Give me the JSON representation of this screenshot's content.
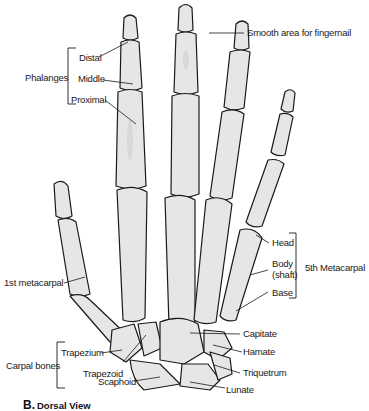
{
  "figure": {
    "caption_letter": "B.",
    "caption_text": "Dorsal View",
    "colors": {
      "bone_fill": "#e6e6e6",
      "outline": "#1a1a1a",
      "background": "#ffffff"
    }
  },
  "labels": {
    "phalanges": {
      "group": "Phalanges",
      "distal": "Distal",
      "middle": "Middle",
      "proximal": "Proximal"
    },
    "fingernail": "Smooth area for fingernail",
    "first_metacarpal": "1st metacarpal",
    "fifth_metacarpal": {
      "group": "5th Metacarpal",
      "head": "Head",
      "body": "Body",
      "shaft": "(shaft)",
      "base": "Base"
    },
    "carpals": {
      "group": "Carpal bones",
      "trapezium": "Trapezium",
      "trapezoid": "Trapezoid",
      "scaphoid": "Scaphoid",
      "capitate": "Capitate",
      "hamate": "Hamate",
      "triquetrum": "Triquetrum",
      "lunate": "Lunate"
    }
  }
}
